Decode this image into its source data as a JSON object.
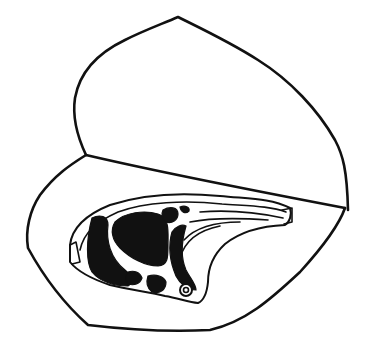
{
  "illustration": {
    "subject": "meat chop on wrapping paper",
    "colors": {
      "ink": "#111111",
      "paper": "#ffffff"
    },
    "parts": [
      {
        "name": "paper-top-flap"
      },
      {
        "name": "paper-fold-line"
      },
      {
        "name": "paper-bottom-sheet"
      },
      {
        "name": "chop"
      }
    ]
  }
}
